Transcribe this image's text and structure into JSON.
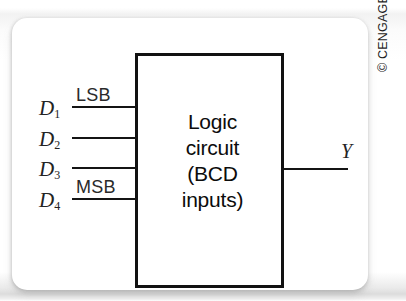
{
  "figure": {
    "title_remnant": "BCD circuit block",
    "block": {
      "lines": [
        "Logic",
        "circuit",
        "(BCD",
        "inputs)"
      ]
    },
    "inputs": [
      {
        "label": "D",
        "subscript": "1",
        "significance": "LSB"
      },
      {
        "label": "D",
        "subscript": "2",
        "significance": ""
      },
      {
        "label": "D",
        "subscript": "3",
        "significance": ""
      },
      {
        "label": "D",
        "subscript": "4",
        "significance": "MSB"
      }
    ],
    "output": {
      "label": "Y"
    },
    "copyright": "© CENGAGE LEARNING 2012."
  },
  "colors": {
    "ink": "#111111",
    "card": "#ffffff",
    "page": "#ffffff"
  }
}
